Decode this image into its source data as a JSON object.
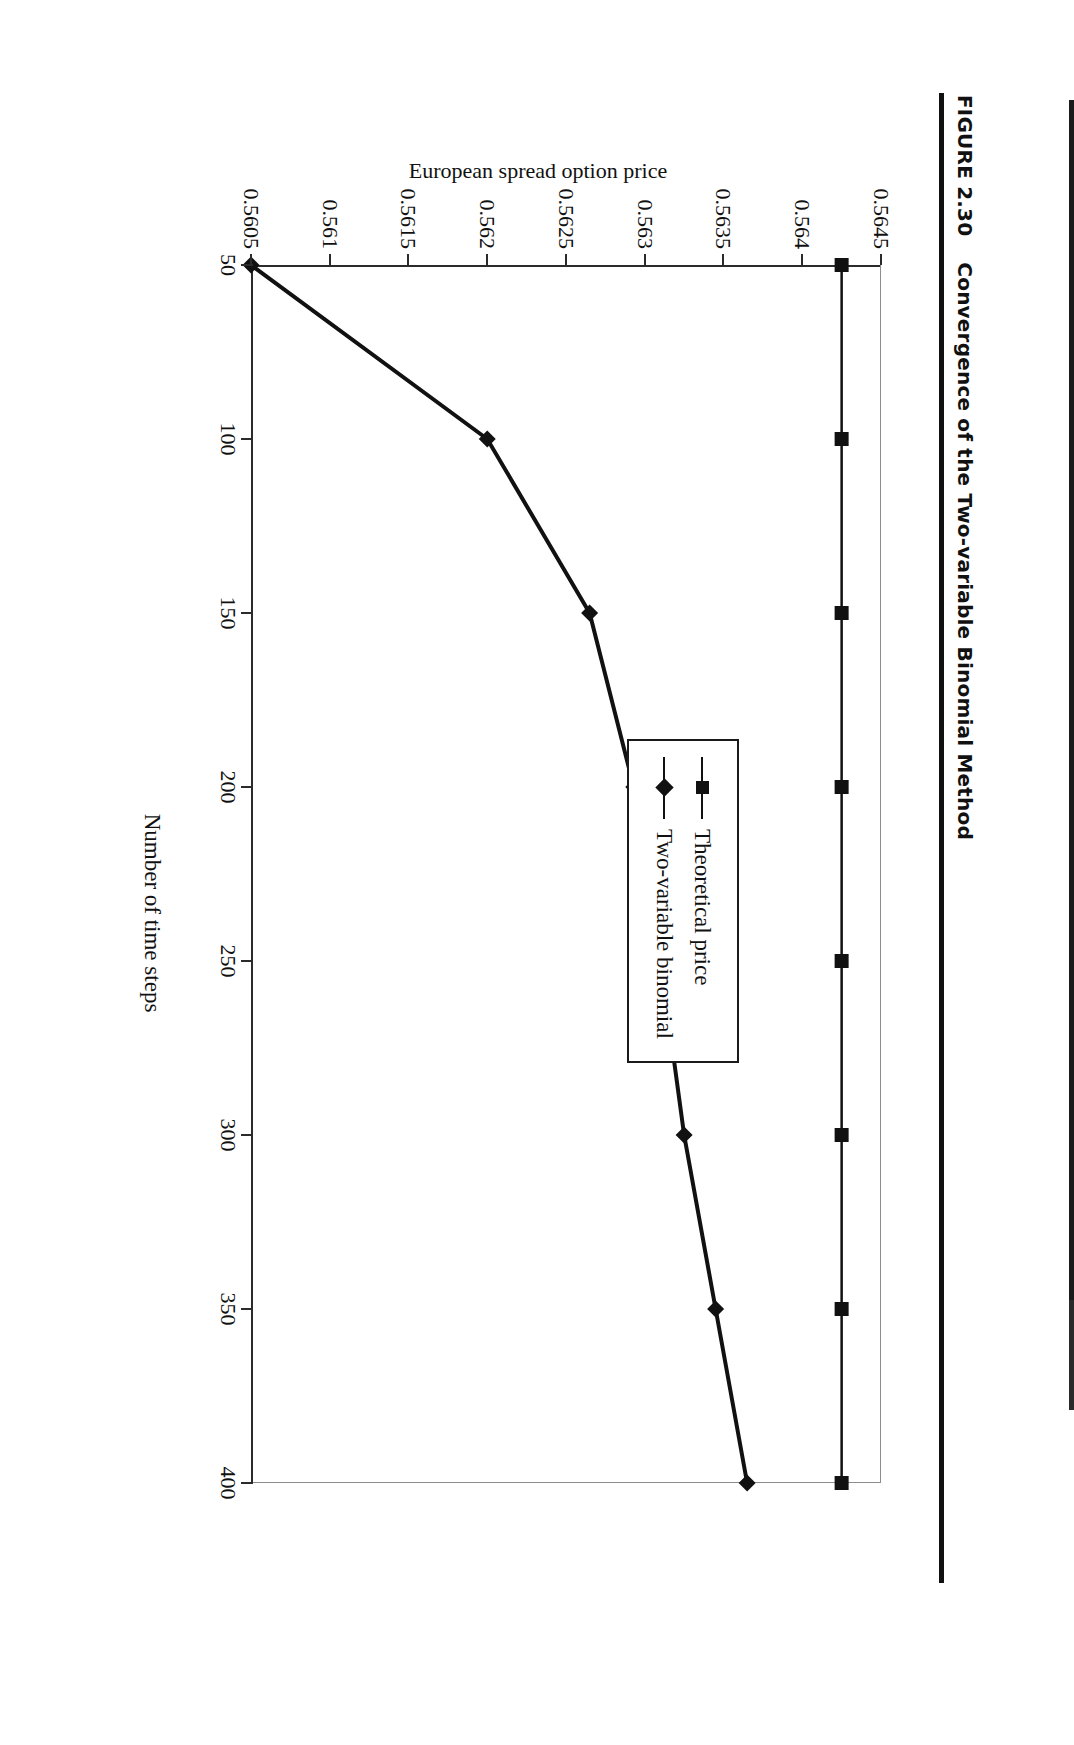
{
  "figure": {
    "number_label": "FIGURE 2.30",
    "title": "Convergence of the Two-variable Binomial Method"
  },
  "chart_data": {
    "type": "line",
    "title": "Convergence of the Two-variable Binomial Method",
    "xlabel": "Number of time steps",
    "ylabel": "European spread option price",
    "x": [
      50,
      100,
      150,
      200,
      250,
      300,
      350,
      400
    ],
    "xlim": [
      50,
      400
    ],
    "ylim": [
      0.5605,
      0.5645
    ],
    "xticks": [
      "50",
      "100",
      "150",
      "200",
      "250",
      "300",
      "350",
      "400"
    ],
    "yticks": [
      "0.5645",
      "0.564",
      "0.5635",
      "0.563",
      "0.5625",
      "0.562",
      "0.5615",
      "0.561",
      "0.5605"
    ],
    "ytick_values": [
      0.5645,
      0.564,
      0.5635,
      0.563,
      0.5625,
      0.562,
      0.5615,
      0.561,
      0.5605
    ],
    "grid": false,
    "legend_position": "inside-center-right",
    "series": [
      {
        "name": "Theoretical price",
        "marker": "square",
        "values": [
          0.56425,
          0.56425,
          0.56425,
          0.56425,
          0.56425,
          0.56425,
          0.56425,
          0.56425
        ]
      },
      {
        "name": "Two-variable binomial",
        "marker": "diamond",
        "values": [
          0.5605,
          0.562,
          0.56265,
          0.56293,
          0.5631,
          0.56325,
          0.56345,
          0.56365
        ]
      }
    ]
  },
  "legend": {
    "items": [
      {
        "label": "Theoretical price",
        "marker": "square-marker-icon"
      },
      {
        "label": "Two-variable binomial",
        "marker": "diamond-marker-icon"
      }
    ]
  }
}
